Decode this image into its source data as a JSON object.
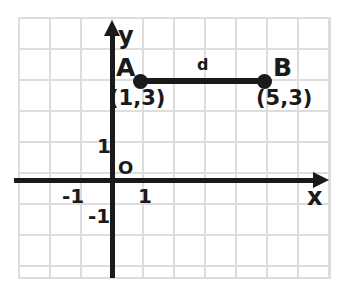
{
  "chart_data": {
    "type": "scatter",
    "title": "",
    "xlabel": "x",
    "ylabel": "y",
    "grid": true,
    "legend": false,
    "xlim": [
      -3,
      7
    ],
    "ylim": [
      -3,
      5
    ],
    "axis_labels": {
      "x": "x",
      "y": "y",
      "origin": "O"
    },
    "tick_labels": {
      "x": [
        "-1",
        "1"
      ],
      "y": [
        "1",
        "-1"
      ]
    },
    "points": [
      {
        "name": "A",
        "label": "A",
        "coord_label": "(1,3)",
        "x": 1,
        "y": 3
      },
      {
        "name": "B",
        "label": "B",
        "coord_label": "(5,3)",
        "x": 5,
        "y": 3
      }
    ],
    "segments": [
      {
        "name": "AB",
        "label": "d",
        "from": "A",
        "to": "B",
        "length": 4
      }
    ],
    "colors": {
      "ink": "#1a1a1a",
      "grid": "#dcdcdc",
      "background": "#ffffff"
    }
  },
  "figure": {
    "point_a_letter": "A",
    "point_b_letter": "B",
    "point_a_coords": "(1,3)",
    "point_b_coords": "(5,3)",
    "distance_label": "d",
    "x_axis_label": "x",
    "y_axis_label": "y",
    "origin_label": "O",
    "tick_y_positive_one": "1",
    "tick_y_negative_one": "-1",
    "tick_x_positive_one": "1",
    "tick_x_negative_one": "-1"
  }
}
